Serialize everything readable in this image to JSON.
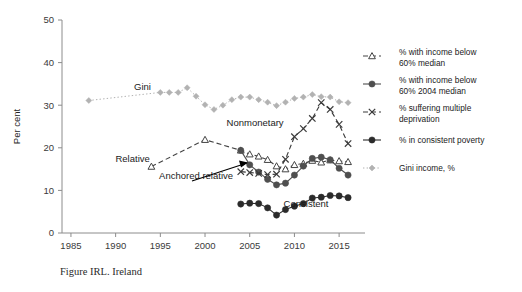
{
  "figure": {
    "caption": "Figure IRL. Ireland"
  },
  "chart_data": {
    "type": "line",
    "title": "",
    "xlabel": "",
    "ylabel": "Per cent",
    "xlim": [
      1984,
      2017
    ],
    "ylim": [
      0,
      50
    ],
    "xticks": [
      1985,
      1990,
      1995,
      2000,
      2005,
      2010,
      2015
    ],
    "yticks": [
      0,
      10,
      20,
      30,
      40,
      50
    ],
    "grid": false,
    "legend_position": "right",
    "annotations": [
      {
        "text": "Gini",
        "x": 1993.0,
        "y": 33.6
      },
      {
        "text": "Nonmonetary",
        "x": 2005.6,
        "y": 25.1
      },
      {
        "text": "Relative",
        "x": 1991.9,
        "y": 16.6
      },
      {
        "text": "Anchored relative",
        "x": 1999.0,
        "y": 12.6
      },
      {
        "text": "Consistent",
        "x": 2011.3,
        "y": 6.0
      }
    ],
    "series": [
      {
        "name": "% with income below 60% median",
        "legend_label_line1": "% with income below",
        "legend_label_line2": "60% median",
        "marker": "triangle-open",
        "color": "#444444",
        "dash": "dashed",
        "x": [
          1994,
          2000,
          2004,
          2005,
          2006,
          2007,
          2008,
          2009,
          2010,
          2011,
          2012,
          2013,
          2014,
          2015,
          2016
        ],
        "y": [
          15.6,
          21.9,
          19.4,
          18.5,
          18.0,
          17.2,
          15.7,
          15.0,
          16.0,
          16.3,
          17.0,
          16.6,
          17.1,
          16.9,
          16.7
        ]
      },
      {
        "name": "% with income below 60% 2004 median",
        "legend_label_line1": "% with income below",
        "legend_label_line2": "60% 2004 median",
        "marker": "circle-filled",
        "color": "#4f4f4f",
        "dash": "solid",
        "x": [
          2004,
          2005,
          2006,
          2007,
          2008,
          2009,
          2010,
          2011,
          2012,
          2013,
          2014,
          2015,
          2016
        ],
        "y": [
          19.4,
          16.0,
          14.3,
          12.6,
          11.3,
          11.7,
          13.6,
          15.7,
          17.5,
          17.8,
          17.2,
          15.2,
          13.6
        ]
      },
      {
        "name": "% suffering multiple deprivation",
        "legend_label_line1": "% suffering multiple",
        "legend_label_line2": "deprivation",
        "marker": "x",
        "color": "#3a3a3a",
        "dash": "dashed",
        "x": [
          2004,
          2005,
          2006,
          2007,
          2008,
          2009,
          2010,
          2011,
          2012,
          2013,
          2014,
          2015,
          2016
        ],
        "y": [
          14.4,
          14.2,
          14.0,
          13.7,
          13.8,
          17.3,
          22.6,
          24.5,
          26.9,
          30.6,
          29.0,
          25.5,
          21.0
        ]
      },
      {
        "name": "% in consistent poverty",
        "legend_label_line1": "% in consistent poverty",
        "legend_label_line2": "",
        "marker": "circle-filled-dark",
        "color": "#2b2b2b",
        "dash": "solid",
        "x": [
          2004,
          2005,
          2006,
          2007,
          2008,
          2009,
          2010,
          2011,
          2012,
          2013,
          2014,
          2015,
          2016
        ],
        "y": [
          6.8,
          7.0,
          6.9,
          5.9,
          4.2,
          5.5,
          6.3,
          6.9,
          8.2,
          8.4,
          8.8,
          8.7,
          8.3
        ]
      },
      {
        "name": "Gini income, %",
        "legend_label_line1": "Gini income, %",
        "legend_label_line2": "",
        "marker": "diamond-filled",
        "color": "#b2b2b2",
        "dash": "dotted",
        "x": [
          1987,
          1995,
          1996,
          1997,
          1998,
          1999,
          2000,
          2001,
          2002,
          2003,
          2004,
          2005,
          2006,
          2007,
          2008,
          2009,
          2010,
          2011,
          2012,
          2013,
          2014,
          2015,
          2016
        ],
        "y": [
          31.1,
          33.0,
          33.0,
          33.0,
          34.1,
          32.1,
          30.1,
          29.0,
          30.0,
          31.3,
          31.9,
          31.9,
          31.3,
          30.7,
          29.9,
          30.7,
          31.6,
          31.9,
          32.5,
          32.0,
          31.9,
          30.8,
          30.6
        ]
      }
    ]
  },
  "legend": {
    "items": [
      {
        "label_line1": "% with income below",
        "label_line2": "60% median",
        "marker": "triangle-open",
        "dash": "dashed",
        "color": "#444444"
      },
      {
        "label_line1": "% with income below",
        "label_line2": "60% 2004 median",
        "marker": "circle-filled",
        "dash": "solid",
        "color": "#4f4f4f"
      },
      {
        "label_line1": "% suffering multiple",
        "label_line2": "deprivation",
        "marker": "x",
        "dash": "dashed",
        "color": "#3a3a3a"
      },
      {
        "label_line1": "% in consistent poverty",
        "label_line2": "",
        "marker": "circle-filled-dark",
        "dash": "solid",
        "color": "#2b2b2b"
      },
      {
        "label_line1": "Gini income, %",
        "label_line2": "",
        "marker": "diamond-filled",
        "dash": "dotted",
        "color": "#b2b2b2"
      }
    ]
  }
}
